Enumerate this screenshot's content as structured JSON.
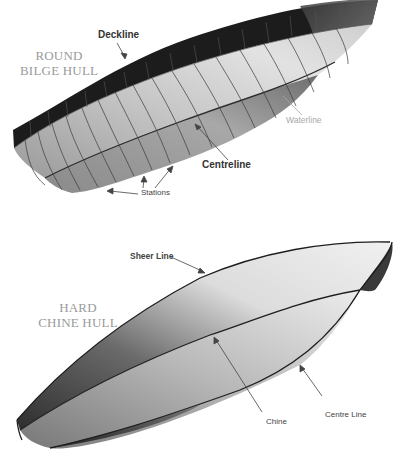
{
  "diagram": {
    "top": {
      "title_line1": "ROUND",
      "title_line2": "BILGE HULL",
      "labels": {
        "deckline": "Deckline",
        "waterline": "Waterline",
        "centreline": "Centreline",
        "stations": "Stations"
      }
    },
    "bottom": {
      "title_line1": "HARD",
      "title_line2": "CHINE HULL",
      "labels": {
        "sheer_line": "Sheer Line",
        "chine": "Chine",
        "centre_line": "Centre Line"
      }
    },
    "colors": {
      "background": "#ffffff",
      "deck_band": "#1a1a1a",
      "hull_mid": "#b5b5b5",
      "hull_light": "#e6e6e6",
      "title_text": "#9a9a9a",
      "outline": "#222222"
    }
  }
}
